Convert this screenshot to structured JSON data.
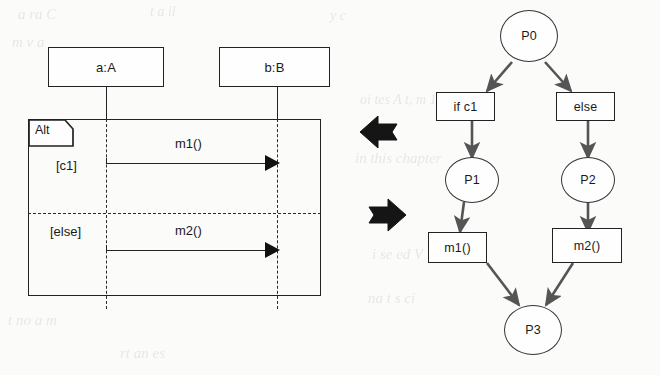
{
  "figure": {
    "kind": "uml-sequence-to-petri-net-transformation",
    "direction_note": "bidirectional transformation between the two models"
  },
  "sequence_diagram": {
    "lifelines": [
      {
        "id": "a",
        "label": "a:A"
      },
      {
        "id": "b",
        "label": "b:B"
      }
    ],
    "fragment": {
      "operator": "Alt",
      "operands": [
        {
          "guard": "[c1]",
          "message": "m1()"
        },
        {
          "guard": "[else]",
          "message": "m2()"
        }
      ]
    }
  },
  "transform_arrows": [
    {
      "name": "arrow-left",
      "direction": "left"
    },
    {
      "name": "arrow-right",
      "direction": "right"
    }
  ],
  "petri_net": {
    "places": [
      {
        "id": "P0",
        "label": "P0"
      },
      {
        "id": "P1",
        "label": "P1"
      },
      {
        "id": "P2",
        "label": "P2"
      },
      {
        "id": "P3",
        "label": "P3"
      }
    ],
    "transitions": [
      {
        "id": "t-if",
        "label": "if c1"
      },
      {
        "id": "t-else",
        "label": "else"
      },
      {
        "id": "t-m1",
        "label": "m1()"
      },
      {
        "id": "t-m2",
        "label": "m2()"
      }
    ],
    "arcs": [
      {
        "from": "P0",
        "to": "t-if"
      },
      {
        "from": "P0",
        "to": "t-else"
      },
      {
        "from": "t-if",
        "to": "P1"
      },
      {
        "from": "t-else",
        "to": "P2"
      },
      {
        "from": "P1",
        "to": "t-m1"
      },
      {
        "from": "P2",
        "to": "t-m2"
      },
      {
        "from": "t-m1",
        "to": "P3"
      },
      {
        "from": "t-m2",
        "to": "P3"
      }
    ]
  },
  "ghost_text": {
    "g1": "a  ra  C",
    "g2": "t  a  il",
    "g3": "y  c",
    "g4": "m  v   a",
    "g5": "in this chapter",
    "g6": "oi  tes  A t,  m  1",
    "g7": "t  no  a  m",
    "g8": "rt  an  es",
    "g9": "i  se  ed  V",
    "g10": "na  t  s  ci"
  }
}
